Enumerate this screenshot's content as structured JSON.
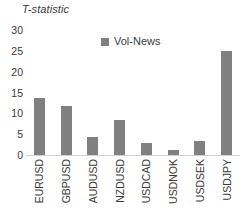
{
  "chart_data": {
    "type": "bar",
    "title": "",
    "ylabel": "T-statistic",
    "xlabel": "",
    "categories": [
      "EURUSD",
      "GBPUSD",
      "AUDUSD",
      "NZDUSD",
      "USDCAD",
      "USDNOK",
      "USDSEK",
      "USDJPY"
    ],
    "series": [
      {
        "name": "Vol-News",
        "color": "#808080",
        "values": [
          13.7,
          11.8,
          4.3,
          8.5,
          2.8,
          1.3,
          3.3,
          25.0
        ]
      }
    ],
    "ylim": [
      0,
      30
    ],
    "yticks": [
      30,
      25,
      20,
      15,
      10,
      5,
      0
    ],
    "ytick_labels": [
      "30",
      "25",
      "20",
      "15",
      "10",
      "5",
      "0"
    ],
    "grid": false,
    "legend": {
      "position": "top-center",
      "entries": [
        {
          "label": "Vol-News",
          "color": "#808080",
          "marker": "square-swatch"
        }
      ]
    },
    "axis_title_style": "italic",
    "xlabel_rotation": -90
  }
}
